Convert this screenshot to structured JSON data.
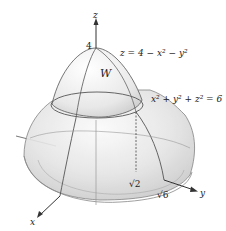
{
  "diagram": {
    "axes": {
      "x_label": "x",
      "y_label": "y",
      "z_label": "z"
    },
    "region_label": "W",
    "surfaces": {
      "paraboloid_eq": "z = 4 − x² − y²",
      "sphere_eq": "x² + y² + z² = 6"
    },
    "tick_labels": {
      "z_top": "4",
      "y_inner": "√2",
      "y_outer": "√6"
    },
    "colors": {
      "surface_fill": "#e6e6e6",
      "surface_dark": "#cfcfcf",
      "outline": "#666666",
      "axis": "#333333"
    }
  }
}
